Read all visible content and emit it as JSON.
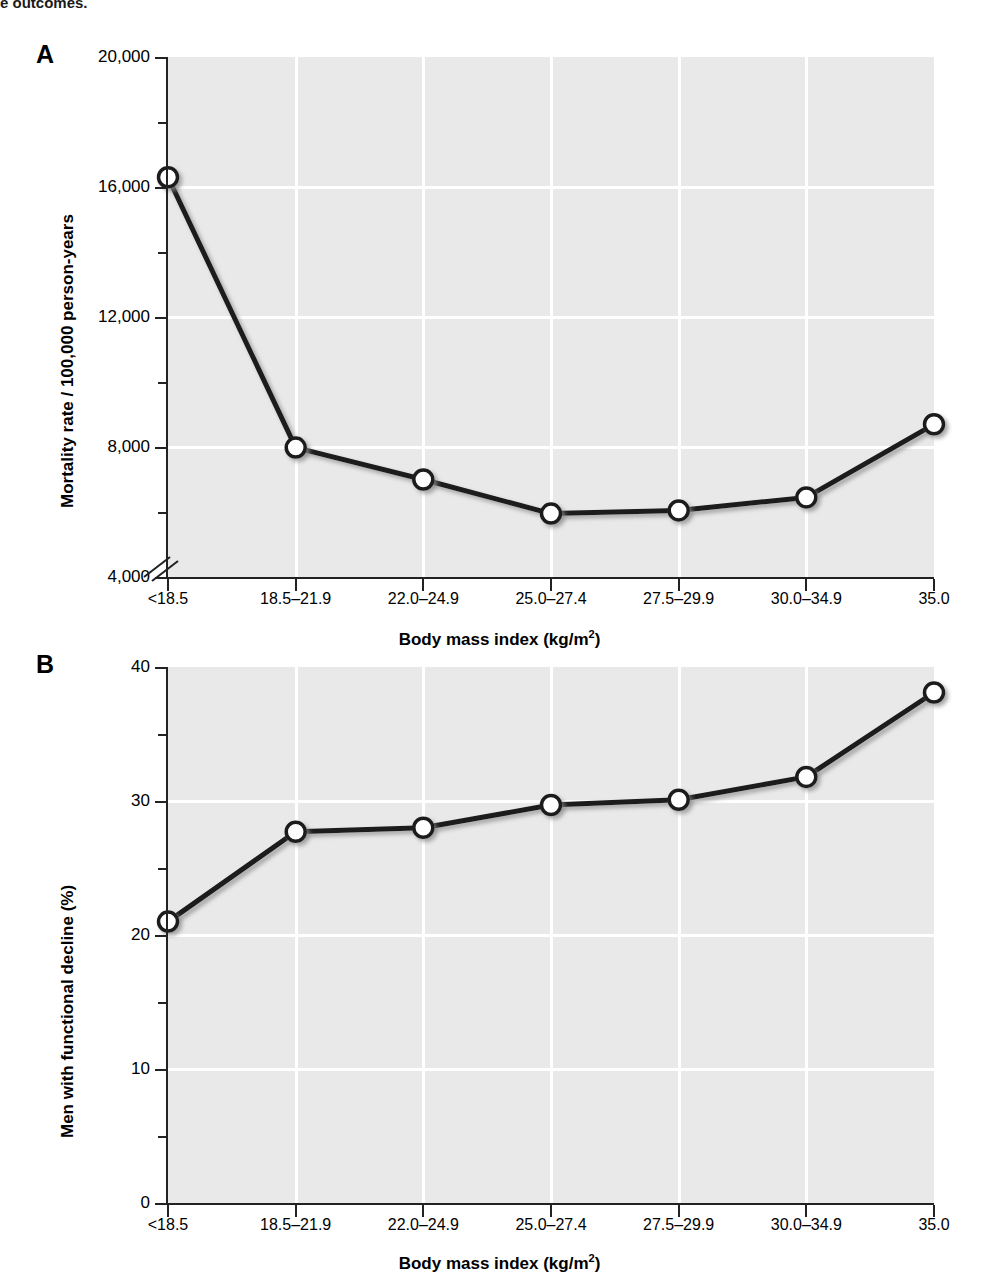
{
  "page": {
    "clipped_caption_fragment": "e outcomes."
  },
  "panels": [
    {
      "letter": "A",
      "y_title": "Mortality rate / 100,000 person-years",
      "x_title_main": "Body mass index (kg/m",
      "x_title_sup": "2",
      "x_title_tail": ")",
      "y_tick_labels": [
        "20,000",
        "16,000",
        "12,000",
        "8,000",
        "4,000"
      ],
      "y_minor_values": [
        18000,
        14000,
        10000,
        6000
      ],
      "has_axis_break": true,
      "x_tick_labels": [
        "<18.5",
        "18.5–21.9",
        "22.0–24.9",
        "25.0–27.4",
        "27.5–29.9",
        "30.0–34.9",
        "35.0"
      ]
    },
    {
      "letter": "B",
      "y_title": "Men with functional decline (%)",
      "x_title_main": "Body mass index (kg/m",
      "x_title_sup": "2",
      "x_title_tail": ")",
      "y_tick_labels": [
        "40",
        "30",
        "20",
        "10",
        "0"
      ],
      "y_minor_values": [
        35,
        25,
        15,
        5
      ],
      "has_axis_break": false,
      "x_tick_labels": [
        "<18.5",
        "18.5–21.9",
        "22.0–24.9",
        "25.0–27.4",
        "27.5–29.9",
        "30.0–34.9",
        "35.0"
      ]
    }
  ],
  "style": {
    "plot_background": "#e9e9e9",
    "gridline_color": "#ffffff",
    "line_color": "#1a1a1a",
    "marker_fill": "#ffffff",
    "marker_stroke": "#1a1a1a",
    "axis_color": "#222222"
  },
  "chart_data": [
    {
      "type": "line",
      "panel": "A",
      "title": "",
      "xlabel": "Body mass index (kg/m2)",
      "ylabel": "Mortality rate / 100,000 person-years",
      "categories": [
        "<18.5",
        "18.5–21.9",
        "22.0–24.9",
        "25.0–27.4",
        "27.5–29.9",
        "30.0–34.9",
        "35.0"
      ],
      "values": [
        16300,
        7980,
        7000,
        5950,
        6050,
        6450,
        8700
      ],
      "ylim": [
        4000,
        20000
      ],
      "yticks": [
        4000,
        8000,
        12000,
        16000,
        20000
      ],
      "y_minor_ticks": [
        6000,
        10000,
        14000,
        18000
      ],
      "axis_break_below": 4800,
      "grid": true,
      "legend": "none",
      "marker": "open-circle"
    },
    {
      "type": "line",
      "panel": "B",
      "title": "",
      "xlabel": "Body mass index (kg/m2)",
      "ylabel": "Men with functional decline (%)",
      "categories": [
        "<18.5",
        "18.5–21.9",
        "22.0–24.9",
        "25.0–27.4",
        "27.5–29.9",
        "30.0–34.9",
        "35.0"
      ],
      "values": [
        21.0,
        27.7,
        28.0,
        29.7,
        30.1,
        31.8,
        38.1
      ],
      "ylim": [
        0,
        40
      ],
      "yticks": [
        0,
        10,
        20,
        30,
        40
      ],
      "y_minor_ticks": [
        5,
        15,
        25,
        35
      ],
      "grid": true,
      "legend": "none",
      "marker": "open-circle"
    }
  ]
}
